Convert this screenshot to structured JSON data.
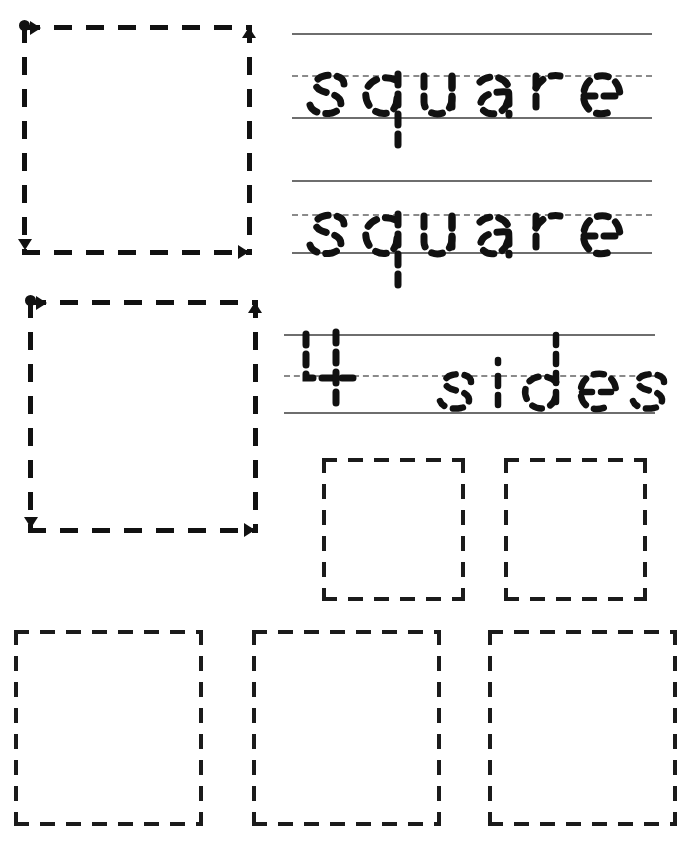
{
  "worksheet": {
    "title": "Square shape tracing worksheet",
    "ink_color": "#111111",
    "rule_line_color": "#6e6e6e",
    "rule_mid_color": "#8a8a8a",
    "background_color": "#ffffff"
  },
  "trace_shapes": [
    {
      "name": "square-trace-1",
      "shape": "square",
      "x": 22,
      "y": 25,
      "size": 230,
      "start_dot": "top-left",
      "direction_arrows": [
        "right",
        "up",
        "right",
        "down"
      ]
    },
    {
      "name": "square-trace-2",
      "shape": "square",
      "x": 28,
      "y": 300,
      "size": 230,
      "start_dot": "top-left",
      "direction_arrows": [
        "right",
        "up",
        "right",
        "down"
      ]
    }
  ],
  "writing_lines": [
    {
      "name": "word-line-1",
      "word": "square",
      "top_y": 33,
      "mid_y": 75,
      "base_y": 117,
      "x_start": 292,
      "x_end": 652
    },
    {
      "name": "word-line-2",
      "word": "square",
      "top_y": 180,
      "mid_y": 214,
      "base_y": 252,
      "x_start": 292,
      "x_end": 652
    },
    {
      "name": "word-line-3",
      "word": "4 sides",
      "top_y": 334,
      "mid_y": 375,
      "base_y": 412,
      "x_start": 284,
      "x_end": 655
    }
  ],
  "practice_squares": [
    {
      "name": "practice-square-1",
      "x": 322,
      "y": 458,
      "w": 143,
      "h": 143
    },
    {
      "name": "practice-square-2",
      "x": 504,
      "y": 458,
      "w": 143,
      "h": 143
    },
    {
      "name": "practice-square-3",
      "x": 14,
      "y": 630,
      "w": 189,
      "h": 196
    },
    {
      "name": "practice-square-4",
      "x": 252,
      "y": 630,
      "w": 189,
      "h": 196
    },
    {
      "name": "practice-square-5",
      "x": 488,
      "y": 630,
      "w": 189,
      "h": 196
    }
  ],
  "labels": {
    "word_square": "square",
    "word_four_sides": "4 sides",
    "numeral_four": "4",
    "word_sides": "sides"
  }
}
